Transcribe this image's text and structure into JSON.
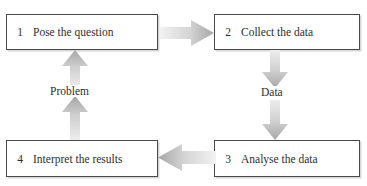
{
  "diagram": {
    "type": "cyclic-process-flow",
    "top_cutoff_text": "",
    "colors": {
      "box_border": "#4a4a4a",
      "text": "#2e2e2e",
      "arrow_light": "#ededed",
      "arrow_mid": "#d2d2d2",
      "arrow_dark": "#a6a6a6",
      "background": "#ffffff"
    },
    "steps": [
      {
        "number": "1",
        "label": "Pose the question"
      },
      {
        "number": "2",
        "label": "Collect the data"
      },
      {
        "number": "3",
        "label": "Analyse the data"
      },
      {
        "number": "4",
        "label": "Interpret the results"
      }
    ],
    "flow_labels": [
      {
        "key": "problem",
        "text": "Problem"
      },
      {
        "key": "data",
        "text": "Data"
      }
    ],
    "connectors": [
      {
        "name": "arrow-step1-to-step2",
        "direction": "right"
      },
      {
        "name": "arrow-step2-to-step3",
        "direction": "down"
      },
      {
        "name": "arrow-step3-to-step4",
        "direction": "left"
      },
      {
        "name": "arrow-step4-to-step1",
        "direction": "up"
      }
    ]
  }
}
